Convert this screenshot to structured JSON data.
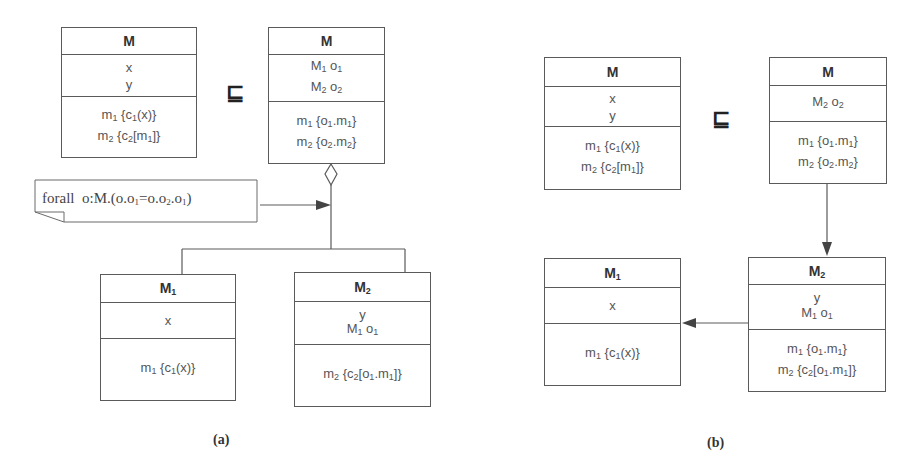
{
  "relation_symbol": "⊑",
  "panel_a": {
    "caption": "(a)",
    "class_M_left": {
      "name": "M",
      "attributes": [
        "x",
        "y"
      ],
      "methods": [
        "m_1 {c_1(x)}",
        "m_2 {c_2[m_1]}"
      ]
    },
    "class_M_right": {
      "name": "M",
      "attributes": [
        "M_1 o_1",
        "M_2 o_2"
      ],
      "methods": [
        "m_1 {o_1.m_1}",
        "m_2 {o_2.m_2}"
      ]
    },
    "class_M1": {
      "name": "M_1",
      "attributes": [
        "x"
      ],
      "methods": [
        "m_1 {c_1(x)}"
      ]
    },
    "class_M2": {
      "name": "M_2",
      "attributes": [
        "y",
        "M_1 o_1"
      ],
      "methods": [
        "m_2 {c_2[o_1.m_1]}"
      ]
    },
    "note": "forall o:M.(o.o_1=o.o_2.o_1)",
    "relationships": [
      {
        "type": "aggregation",
        "from": "M (right)",
        "to": [
          "M_1",
          "M_2"
        ]
      },
      {
        "type": "note-anchor",
        "from": "note",
        "to": "aggregation"
      }
    ]
  },
  "panel_b": {
    "caption": "(b)",
    "class_M_left": {
      "name": "M",
      "attributes": [
        "x",
        "y"
      ],
      "methods": [
        "m_1 {c_1(x)}",
        "m_2 {c_2[m_1]}"
      ]
    },
    "class_M_right": {
      "name": "M",
      "attributes": [
        "M_2 o_2"
      ],
      "methods": [
        "m_1 {o_1.m_1}",
        "m_2 {o_2.m_2}"
      ]
    },
    "class_M1": {
      "name": "M_1",
      "attributes": [
        "x"
      ],
      "methods": [
        "m_1 {c_1(x)}"
      ]
    },
    "class_M2": {
      "name": "M_2",
      "attributes": [
        "y",
        "M_1 o_1"
      ],
      "methods": [
        "m_1 {o_1.m_1}",
        "m_2 {c_2[o_1.m_1]}"
      ]
    },
    "relationships": [
      {
        "type": "association",
        "from": "M (right)",
        "to": "M_2"
      },
      {
        "type": "association",
        "from": "M_2",
        "to": "M_1"
      }
    ]
  },
  "colors": {
    "line": "#5a5a5a",
    "text": "#555555",
    "bold_text": "#333333",
    "background": "#ffffff"
  }
}
